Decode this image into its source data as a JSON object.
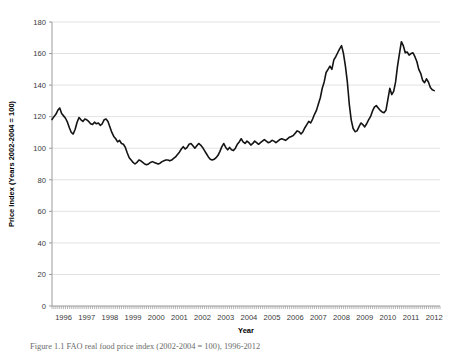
{
  "figure": {
    "caption": "Figure 1.1 FAO real food price index (2002-2004 = 100), 1996-2012"
  },
  "chart_data": {
    "type": "line",
    "title": "",
    "xlabel": "Year",
    "ylabel": "Price Index (Years 2002-2004 = 100)",
    "xlim": [
      1996,
      2012.75
    ],
    "ylim": [
      0,
      180
    ],
    "ytick_values": [
      0,
      20,
      40,
      60,
      80,
      100,
      120,
      140,
      160,
      180
    ],
    "ytick_labels": [
      "0",
      "20",
      "40",
      "60",
      "80",
      "100",
      "120",
      "140",
      "160",
      "180"
    ],
    "xtick_values": [
      1996,
      1997,
      1998,
      1999,
      2000,
      2001,
      2002,
      2003,
      2004,
      2005,
      2006,
      2007,
      2008,
      2009,
      2010,
      2011,
      2012
    ],
    "xtick_labels": [
      "1996",
      "1997",
      "1998",
      "1999",
      "2000",
      "2001",
      "2002",
      "2003",
      "2004",
      "2005",
      "2006",
      "2007",
      "2008",
      "2009",
      "2010",
      "2011",
      "2012"
    ],
    "minor_xticks_per_year": 12,
    "grid": "horizontal",
    "legend": "none",
    "line_color": "#141414",
    "line_width": 1.6,
    "series": [
      {
        "name": "FAO real food price index",
        "x_start": 1996.0,
        "x_step": 0.08333333,
        "values": [
          118.2,
          120.0,
          121.5,
          124.0,
          125.5,
          122.0,
          120.5,
          119.0,
          116.5,
          113.0,
          110.0,
          109.0,
          112.0,
          116.5,
          119.5,
          118.0,
          117.0,
          118.5,
          118.0,
          117.0,
          115.5,
          115.0,
          116.5,
          115.5,
          116.0,
          114.5,
          115.5,
          118.0,
          118.5,
          117.0,
          113.5,
          110.0,
          107.5,
          106.0,
          104.0,
          105.0,
          103.0,
          102.5,
          100.5,
          97.0,
          94.0,
          92.5,
          91.0,
          90.0,
          91.0,
          92.5,
          92.0,
          91.0,
          90.0,
          89.5,
          90.0,
          91.0,
          91.5,
          91.0,
          90.5,
          90.0,
          90.5,
          91.5,
          92.0,
          92.5,
          92.5,
          92.0,
          92.5,
          93.5,
          94.5,
          96.0,
          97.5,
          99.5,
          101.0,
          99.5,
          100.5,
          102.5,
          103.0,
          101.5,
          100.0,
          101.5,
          103.0,
          102.0,
          100.5,
          98.5,
          96.5,
          94.5,
          93.0,
          92.5,
          93.0,
          94.0,
          95.5,
          98.0,
          101.0,
          103.0,
          100.5,
          99.0,
          100.5,
          99.0,
          98.5,
          100.0,
          102.5,
          104.0,
          106.0,
          104.0,
          103.0,
          104.5,
          103.5,
          102.0,
          103.0,
          104.5,
          103.5,
          102.5,
          103.5,
          104.5,
          105.5,
          104.5,
          103.5,
          104.0,
          105.0,
          104.5,
          103.5,
          104.5,
          105.5,
          106.0,
          105.5,
          105.0,
          106.0,
          107.0,
          107.5,
          108.0,
          109.5,
          111.0,
          110.5,
          109.0,
          110.5,
          113.0,
          115.0,
          117.0,
          116.0,
          118.5,
          121.5,
          124.0,
          128.0,
          132.0,
          138.0,
          142.0,
          148.0,
          150.0,
          152.0,
          150.0,
          156.0,
          158.0,
          160.5,
          163.0,
          165.0,
          160.0,
          152.0,
          142.0,
          128.0,
          118.0,
          112.5,
          110.5,
          111.0,
          113.5,
          116.0,
          115.0,
          113.5,
          115.5,
          118.0,
          120.0,
          123.5,
          126.0,
          127.0,
          125.5,
          124.0,
          123.0,
          122.5,
          124.0,
          131.0,
          138.0,
          134.0,
          136.0,
          142.0,
          152.0,
          160.0,
          167.5,
          165.0,
          160.5,
          161.0,
          159.0,
          160.0,
          160.5,
          158.0,
          155.0,
          150.0,
          147.5,
          143.0,
          141.5,
          144.0,
          142.0,
          138.5,
          137.0,
          136.5
        ]
      }
    ]
  }
}
